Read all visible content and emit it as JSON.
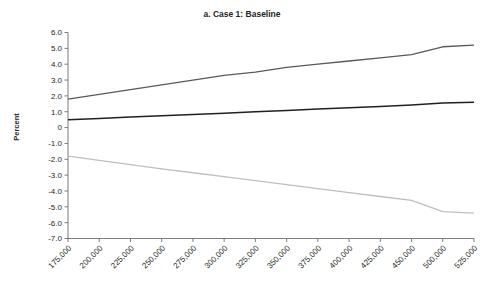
{
  "chart_data": {
    "type": "line",
    "title": "a. Case 1: Baseline",
    "xlabel": "",
    "ylabel": "Percent",
    "grid": false,
    "legend": "none",
    "ylim": [
      -7.0,
      6.0
    ],
    "ytick_labels": [
      "6.0",
      "5.0",
      "4.0",
      "3.0",
      "2.0",
      "1.0",
      "0",
      "-1.0",
      "-2.0",
      "-3.0",
      "-4.0",
      "-5.0",
      "-6.0",
      "-7.0"
    ],
    "ytick_values": [
      6.0,
      5.0,
      4.0,
      3.0,
      2.0,
      1.0,
      0,
      -1.0,
      -2.0,
      -3.0,
      -4.0,
      -5.0,
      -6.0,
      -7.0
    ],
    "categories": [
      "175,000",
      "200,000",
      "225,000",
      "250,000",
      "275,000",
      "300,000",
      "325,000",
      "350,000",
      "375,000",
      "400,000",
      "425,000",
      "450,000",
      "500,000",
      "525,000"
    ],
    "series": [
      {
        "name": "upper-band",
        "color": "#58595b",
        "width": 1.3,
        "values": [
          1.8,
          2.1,
          2.4,
          2.7,
          3.0,
          3.3,
          3.5,
          3.8,
          4.0,
          4.2,
          4.4,
          4.6,
          5.1,
          5.2
        ]
      },
      {
        "name": "central-estimate",
        "color": "#231f20",
        "width": 1.5,
        "values": [
          0.5,
          0.58,
          0.66,
          0.75,
          0.83,
          0.91,
          1.0,
          1.08,
          1.17,
          1.25,
          1.33,
          1.42,
          1.55,
          1.6
        ]
      },
      {
        "name": "lower-band",
        "color": "#bcbec0",
        "width": 1.3,
        "values": [
          -1.8,
          -2.07,
          -2.34,
          -2.6,
          -2.85,
          -3.1,
          -3.35,
          -3.6,
          -3.85,
          -4.1,
          -4.35,
          -4.6,
          -5.3,
          -5.4
        ]
      }
    ]
  }
}
